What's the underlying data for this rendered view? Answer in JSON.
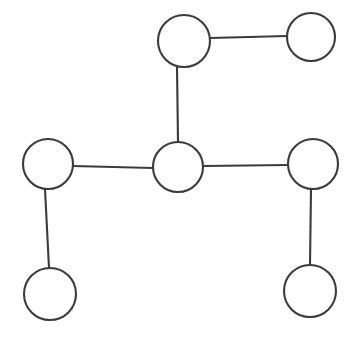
{
  "diagram": {
    "type": "node-link-graph",
    "canvas": {
      "width": 357,
      "height": 340
    },
    "style": {
      "background_color": "#ffffff",
      "node_fill_color": "#ffffff",
      "node_stroke_color": "#3b3b3f",
      "edge_color": "#3b3b3f",
      "stroke_width": 2.1
    },
    "node_count": 7,
    "edge_count": 6,
    "nodes": [
      {
        "id": "n1",
        "name": "top-middle-node",
        "label": "",
        "cx": 184,
        "cy": 41,
        "r": 26
      },
      {
        "id": "n2",
        "name": "top-right-node",
        "label": "",
        "cx": 311,
        "cy": 37,
        "r": 24
      },
      {
        "id": "n3",
        "name": "center-node",
        "label": "",
        "cx": 178,
        "cy": 167,
        "r": 25
      },
      {
        "id": "n4",
        "name": "left-middle-node",
        "label": "",
        "cx": 48,
        "cy": 164,
        "r": 25
      },
      {
        "id": "n5",
        "name": "right-middle-node",
        "label": "",
        "cx": 313,
        "cy": 164,
        "r": 25
      },
      {
        "id": "n6",
        "name": "bottom-left-node",
        "label": "",
        "cx": 50,
        "cy": 294,
        "r": 26
      },
      {
        "id": "n7",
        "name": "bottom-right-node",
        "label": "",
        "cx": 310,
        "cy": 291,
        "r": 26
      }
    ],
    "edges": [
      {
        "id": "e1",
        "name": "edge-top-middle-to-top-right",
        "source": "n1",
        "target": "n2",
        "x1": 210,
        "y1": 38,
        "x2": 287,
        "y2": 36
      },
      {
        "id": "e2",
        "name": "edge-top-middle-to-center",
        "source": "n1",
        "target": "n3",
        "x1": 177,
        "y1": 67,
        "x2": 178,
        "y2": 142
      },
      {
        "id": "e3",
        "name": "edge-left-middle-to-center",
        "source": "n4",
        "target": "n3",
        "x1": 73,
        "y1": 166,
        "x2": 153,
        "y2": 168
      },
      {
        "id": "e4",
        "name": "edge-center-to-right-middle",
        "source": "n3",
        "target": "n5",
        "x1": 203,
        "y1": 166,
        "x2": 288,
        "y2": 165
      },
      {
        "id": "e5",
        "name": "edge-left-middle-to-bottom-left",
        "source": "n4",
        "target": "n6",
        "x1": 45,
        "y1": 189,
        "x2": 49,
        "y2": 268
      },
      {
        "id": "e6",
        "name": "edge-right-middle-to-bottom-right",
        "source": "n5",
        "target": "n7",
        "x1": 311,
        "y1": 189,
        "x2": 310,
        "y2": 265
      }
    ]
  }
}
